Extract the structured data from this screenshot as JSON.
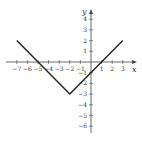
{
  "chart_data": {
    "type": "line",
    "title": "",
    "xlabel": "x",
    "ylabel": "y",
    "xlim": [
      -7,
      3
    ],
    "ylim": [
      -6,
      4
    ],
    "x_ticks": [
      -7,
      -6,
      -5,
      -4,
      -3,
      -2,
      -1,
      1,
      2,
      3
    ],
    "y_ticks": [
      4,
      3,
      2,
      1,
      -1,
      -2,
      -3,
      -4,
      -5,
      -6
    ],
    "grid": false,
    "legend": null,
    "series": [
      {
        "name": "y = |x + 2| - 3",
        "x": [
          -7,
          -2,
          3
        ],
        "y": [
          2,
          -3,
          2
        ],
        "color": "#222222"
      }
    ]
  },
  "colors": {
    "axis": "#444444",
    "line": "#222222",
    "background": "#ffffff"
  }
}
